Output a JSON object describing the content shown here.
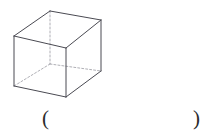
{
  "page": {
    "background_color": "#ffffff",
    "width": 215,
    "height": 137
  },
  "figure": {
    "name": "cuboid-wireframe",
    "stroke_color": "#4a4a52",
    "hidden_stroke_color": "#9a9aa2",
    "stroke_width": 1,
    "hidden_stroke_width": 0.8,
    "hidden_dash_pattern": "2,2",
    "fill": "none",
    "vertices": {
      "front_top_left": [
        14,
        36
      ],
      "front_top_right": [
        66,
        48
      ],
      "front_bottom_right": [
        66,
        97
      ],
      "front_bottom_left": [
        14,
        86
      ],
      "back_top_left": [
        50,
        11
      ],
      "back_top_right": [
        101,
        20
      ],
      "back_bottom_right": [
        101,
        71
      ],
      "back_bottom_left": [
        50,
        64
      ]
    },
    "visible_edges": [
      [
        "front_top_left",
        "front_top_right"
      ],
      [
        "front_top_right",
        "front_bottom_right"
      ],
      [
        "front_bottom_right",
        "front_bottom_left"
      ],
      [
        "front_bottom_left",
        "front_top_left"
      ],
      [
        "back_top_left",
        "back_top_right"
      ],
      [
        "back_top_right",
        "back_bottom_right"
      ],
      [
        "front_top_left",
        "back_top_left"
      ],
      [
        "front_top_right",
        "back_top_right"
      ],
      [
        "front_bottom_right",
        "back_bottom_right"
      ]
    ],
    "hidden_edges": [
      [
        "back_top_left",
        "back_bottom_left"
      ],
      [
        "back_bottom_left",
        "back_bottom_right"
      ],
      [
        "back_bottom_left",
        "front_bottom_left"
      ]
    ]
  },
  "answer": {
    "open_paren": "(",
    "close_paren": ")",
    "blank_value": ""
  }
}
